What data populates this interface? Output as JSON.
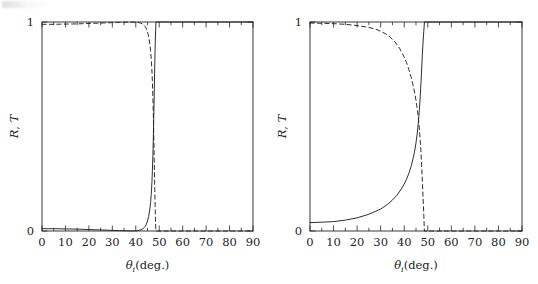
{
  "figure": {
    "title": "",
    "background_color": "#ffffff",
    "ink_color": "#242424",
    "panel_count": 2
  },
  "panels": [
    {
      "id": "left",
      "name": "panel-left",
      "ylabel": "R, T",
      "ylabel_parts": {
        "r": "R",
        "comma": ",",
        "t": "T"
      },
      "xlabel_theta": "θ",
      "xlabel_sub": "i",
      "xlabel_unit": "(deg.)",
      "ytick_labels": [
        "0",
        "1"
      ],
      "xtick_labels": [
        "0",
        "10",
        "20",
        "30",
        "40",
        "50",
        "60",
        "70",
        "80",
        "90"
      ]
    },
    {
      "id": "right",
      "name": "panel-right",
      "ylabel": "R, T",
      "ylabel_parts": {
        "r": "R",
        "comma": ",",
        "t": "T"
      },
      "xlabel_theta": "θ",
      "xlabel_sub": "i",
      "xlabel_unit": "(deg.)",
      "ytick_labels": [
        "0",
        "1"
      ],
      "xtick_labels": [
        "0",
        "10",
        "20",
        "30",
        "40",
        "50",
        "60",
        "70",
        "80",
        "90"
      ]
    }
  ],
  "chart_data": [
    {
      "type": "line",
      "panel": "left",
      "title": "",
      "xlabel": "θ_i (deg.)",
      "ylabel": "R, T",
      "xlim": [
        0,
        90
      ],
      "ylim": [
        0,
        1.0
      ],
      "xticks": [
        0,
        10,
        20,
        30,
        40,
        50,
        60,
        70,
        80,
        90
      ],
      "yticks": [
        0,
        1
      ],
      "minor_tick_step": 5,
      "grid": false,
      "legend": null,
      "critical_angle_deg": 48.6,
      "series": [
        {
          "name": "R",
          "style": "solid",
          "color": "#242424",
          "x": [
            0,
            5,
            10,
            15,
            20,
            25,
            30,
            33,
            36,
            38,
            40,
            41,
            42,
            43,
            44,
            44.5,
            45,
            45.5,
            46,
            46.3,
            46.6,
            46.9,
            47.1,
            47.3,
            47.5,
            47.7,
            47.9,
            48.1,
            48.3,
            48.6,
            50,
            55,
            60,
            65,
            70,
            75,
            80,
            85,
            90
          ],
          "y": [
            0.011,
            0.011,
            0.01,
            0.009,
            0.007,
            0.005,
            0.003,
            0.002,
            0.001,
            0.0005,
            0.0008,
            0.002,
            0.005,
            0.01,
            0.022,
            0.032,
            0.048,
            0.07,
            0.105,
            0.135,
            0.175,
            0.235,
            0.29,
            0.36,
            0.45,
            0.56,
            0.68,
            0.8,
            0.9,
            1.0,
            1.0,
            1.0,
            1.0,
            1.0,
            1.0,
            1.0,
            1.0,
            1.0,
            1.0
          ]
        },
        {
          "name": "T",
          "style": "dashed",
          "color": "#242424",
          "x": [
            0,
            5,
            10,
            15,
            20,
            25,
            30,
            33,
            36,
            38,
            40,
            41,
            42,
            43,
            44,
            44.5,
            45,
            45.5,
            46,
            46.3,
            46.6,
            46.9,
            47.1,
            47.3,
            47.5,
            47.7,
            47.9,
            48.1,
            48.3,
            48.55,
            48.6,
            50,
            55,
            60,
            65,
            70,
            75,
            80,
            85,
            90
          ],
          "y": [
            0.989,
            0.989,
            0.99,
            0.991,
            0.993,
            0.995,
            0.997,
            0.998,
            0.999,
            0.9995,
            0.999,
            0.998,
            0.995,
            0.99,
            0.978,
            0.968,
            0.952,
            0.93,
            0.895,
            0.865,
            0.825,
            0.765,
            0.71,
            0.64,
            0.55,
            0.44,
            0.32,
            0.2,
            0.1,
            0.0,
            0.0,
            0.0,
            0.0,
            0.0,
            0.0,
            0.0,
            0.0,
            0.0,
            0.0,
            0.0
          ]
        }
      ]
    },
    {
      "type": "line",
      "panel": "right",
      "title": "",
      "xlabel": "θ_i (deg.)",
      "ylabel": "R, T",
      "xlim": [
        0,
        90
      ],
      "ylim": [
        0,
        1.0
      ],
      "xticks": [
        0,
        10,
        20,
        30,
        40,
        50,
        60,
        70,
        80,
        90
      ],
      "yticks": [
        0,
        1
      ],
      "minor_tick_step": 5,
      "grid": false,
      "legend": null,
      "critical_angle_deg": 48.6,
      "series": [
        {
          "name": "R",
          "style": "solid",
          "color": "#242424",
          "x": [
            0,
            5,
            10,
            15,
            20,
            25,
            30,
            33,
            35,
            37,
            39,
            40,
            41,
            42,
            43,
            44,
            44.5,
            45,
            45.5,
            46,
            46.4,
            46.8,
            47.1,
            47.4,
            47.7,
            48.0,
            48.3,
            48.6,
            50,
            55,
            60,
            65,
            70,
            75,
            80,
            85,
            90
          ],
          "y": [
            0.04,
            0.042,
            0.045,
            0.052,
            0.063,
            0.08,
            0.105,
            0.128,
            0.148,
            0.172,
            0.205,
            0.225,
            0.248,
            0.277,
            0.312,
            0.358,
            0.387,
            0.422,
            0.465,
            0.52,
            0.575,
            0.645,
            0.705,
            0.775,
            0.845,
            0.905,
            0.955,
            1.0,
            1.0,
            1.0,
            1.0,
            1.0,
            1.0,
            1.0,
            1.0,
            1.0,
            1.0
          ]
        },
        {
          "name": "T",
          "style": "dashed",
          "color": "#242424",
          "x": [
            0,
            5,
            10,
            15,
            20,
            25,
            28,
            30,
            32,
            34,
            36,
            38,
            40,
            41,
            42,
            43,
            44,
            44.5,
            45,
            45.5,
            46,
            46.4,
            46.8,
            47.1,
            47.4,
            47.7,
            48.0,
            48.3,
            48.55,
            48.6,
            50,
            55,
            60,
            65,
            70,
            75,
            80,
            85,
            90
          ],
          "y": [
            0.995,
            0.994,
            0.992,
            0.989,
            0.983,
            0.974,
            0.965,
            0.956,
            0.944,
            0.928,
            0.905,
            0.875,
            0.832,
            0.805,
            0.772,
            0.733,
            0.686,
            0.658,
            0.625,
            0.586,
            0.54,
            0.492,
            0.432,
            0.378,
            0.312,
            0.238,
            0.16,
            0.082,
            0.0,
            0.0,
            0.0,
            0.0,
            0.0,
            0.0,
            0.0,
            0.0,
            0.0,
            0.0,
            0.0
          ]
        }
      ]
    }
  ]
}
